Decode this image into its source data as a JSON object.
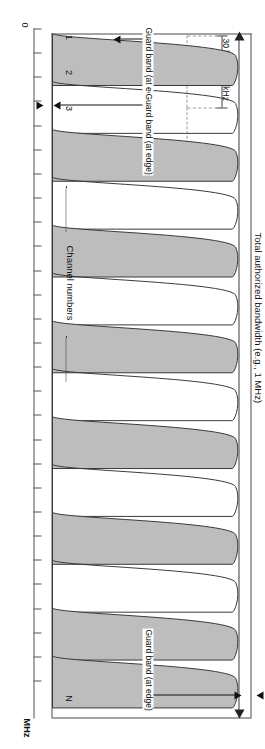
{
  "figure": {
    "title_label": "Total authorized bandwidth (e.g., 1 MHz)",
    "channel_numbers_label": "Channel numbers",
    "axis_unit": "MHz",
    "axis_origin": "0",
    "channel_width_label_1": "30 kHz",
    "channel_width_label_2": "30 kHz",
    "guard_band_label_edge_top": "Guard band (at edge)",
    "guard_band_label_edge_bottom": "Guard band (at edge)",
    "guard_band_label_inner": "Guard band (at edge)",
    "channel_labels": [
      "1",
      "2",
      "3",
      "N"
    ],
    "fill_color": "#bdbdbd",
    "stroke_color": "#3a3a3a",
    "dash_color": "#9a9a9a"
  },
  "chart_data": {
    "type": "line",
    "title": "Total authorized bandwidth (e.g., 1 MHz)",
    "xlabel": "MHz",
    "ylabel": "",
    "grid": false,
    "legend": "none",
    "xlim": [
      0,
      1
    ],
    "ylim": [
      0,
      1
    ],
    "channel_count_drawn": 14,
    "channel_width_khz": 30,
    "total_bandwidth_mhz": 1,
    "channels": [
      {
        "number": "1",
        "shaded": true,
        "center_fraction": 0.038
      },
      {
        "number": "2",
        "shaded": false,
        "center_fraction": 0.108
      },
      {
        "number": "3",
        "shaded": true,
        "center_fraction": 0.178
      },
      {
        "number": "4",
        "shaded": false,
        "center_fraction": 0.248
      },
      {
        "number": "5",
        "shaded": true,
        "center_fraction": 0.318
      },
      {
        "number": "6",
        "shaded": false,
        "center_fraction": 0.388
      },
      {
        "number": "7",
        "shaded": true,
        "center_fraction": 0.458
      },
      {
        "number": "8",
        "shaded": false,
        "center_fraction": 0.528
      },
      {
        "number": "9",
        "shaded": true,
        "center_fraction": 0.598
      },
      {
        "number": "10",
        "shaded": false,
        "center_fraction": 0.668
      },
      {
        "number": "11",
        "shaded": true,
        "center_fraction": 0.738
      },
      {
        "number": "12",
        "shaded": false,
        "center_fraction": 0.808
      },
      {
        "number": "13",
        "shaded": true,
        "center_fraction": 0.878
      },
      {
        "number": "N",
        "shaded": true,
        "center_fraction": 0.948
      }
    ],
    "axis_ticks": [
      0.0,
      0.035,
      0.07,
      0.105,
      0.14,
      0.175,
      0.21,
      0.245,
      0.28,
      0.315,
      0.35,
      0.385,
      0.42,
      0.455,
      0.49,
      0.525,
      0.56,
      0.595,
      0.63,
      0.665,
      0.7,
      0.735,
      0.77,
      0.805,
      0.84,
      0.875,
      0.91,
      0.945
    ]
  }
}
